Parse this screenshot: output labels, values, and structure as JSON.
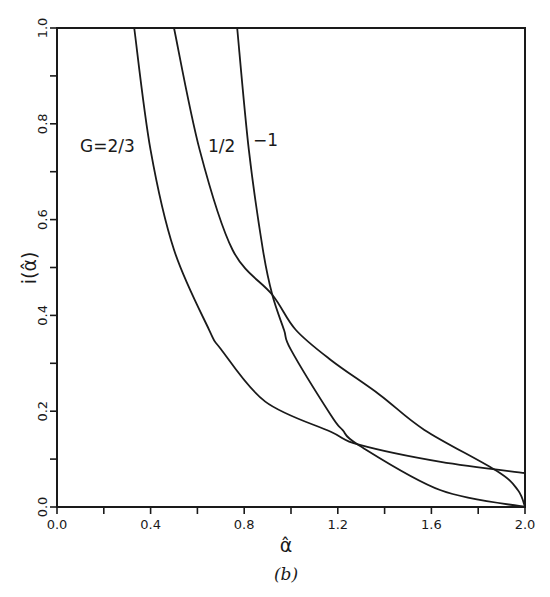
{
  "chart_data": {
    "type": "line",
    "title": "",
    "panel_label": "(b)",
    "xlabel": "α̂",
    "ylabel": "i(α̂)",
    "xlim": [
      0.0,
      2.0
    ],
    "ylim": [
      0.0,
      1.0
    ],
    "grid": false,
    "legend": "inline labels on curves",
    "x_ticks": [
      "0.0",
      "0.4",
      "0.8",
      "1.2",
      "1.6",
      "2.0"
    ],
    "x_minor_ticks": [
      0.2,
      0.6,
      1.0,
      1.4,
      1.8
    ],
    "y_ticks": [
      "0.0",
      "0.2",
      "0.4",
      "0.6",
      "0.8",
      "1.0"
    ],
    "y_minor_ticks": [
      0.1,
      0.3,
      0.5,
      0.7,
      0.9
    ],
    "series": [
      {
        "name": "G=2/3",
        "label": "G=2/3",
        "x": [
          0.33,
          0.4,
          0.5,
          0.65,
          0.7,
          0.89,
          1.17,
          1.29,
          1.64,
          2.0
        ],
        "y": [
          1.0,
          0.745,
          0.537,
          0.37,
          0.33,
          0.22,
          0.157,
          0.13,
          0.094,
          0.071
        ]
      },
      {
        "name": "1/2",
        "label": "1/2",
        "x": [
          0.5,
          0.61,
          0.75,
          0.92,
          1.02,
          1.17,
          1.38,
          1.57,
          1.88,
          1.97,
          2.0
        ],
        "y": [
          1.0,
          0.745,
          0.537,
          0.443,
          0.37,
          0.307,
          0.234,
          0.161,
          0.075,
          0.035,
          0.0
        ]
      },
      {
        "name": "-1",
        "label": "−1",
        "x": [
          0.77,
          0.82,
          0.88,
          0.92,
          0.97,
          1.0,
          1.17,
          1.22,
          1.29,
          1.64,
          2.0
        ],
        "y": [
          1.0,
          0.745,
          0.537,
          0.443,
          0.37,
          0.328,
          0.192,
          0.161,
          0.129,
          0.035,
          0.0
        ]
      }
    ]
  }
}
